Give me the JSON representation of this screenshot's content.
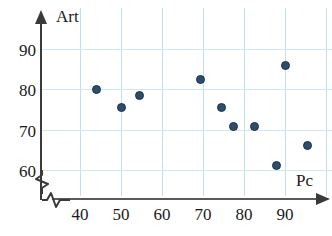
{
  "chart_data": {
    "type": "scatter",
    "title": "",
    "xlabel": "Pc",
    "ylabel": "Art",
    "xlim": [
      35,
      100
    ],
    "ylim": [
      55,
      95
    ],
    "xticks": [
      40,
      50,
      60,
      70,
      80,
      90
    ],
    "yticks": [
      60,
      70,
      80,
      90
    ],
    "grid": true,
    "axis_break_x": true,
    "axis_break_y": true,
    "legend": "none",
    "marker_color": "#2d4d6b",
    "grid_color": "#bfe0ec",
    "axis_color": "#3a3a3a",
    "points": [
      {
        "x": 44.0,
        "y": 80.0
      },
      {
        "x": 50.0,
        "y": 75.5
      },
      {
        "x": 54.5,
        "y": 78.5
      },
      {
        "x": 69.5,
        "y": 82.5
      },
      {
        "x": 74.5,
        "y": 75.5
      },
      {
        "x": 77.5,
        "y": 70.8
      },
      {
        "x": 82.5,
        "y": 70.8
      },
      {
        "x": 88.0,
        "y": 61.0
      },
      {
        "x": 90.0,
        "y": 86.0
      },
      {
        "x": 95.5,
        "y": 66.0
      }
    ]
  },
  "axes": {
    "y_title": "Art",
    "x_title": "Pc",
    "y_tick_labels": [
      "90",
      "80",
      "70",
      "60"
    ],
    "x_tick_labels": [
      "40",
      "50",
      "60",
      "70",
      "80",
      "90"
    ]
  }
}
